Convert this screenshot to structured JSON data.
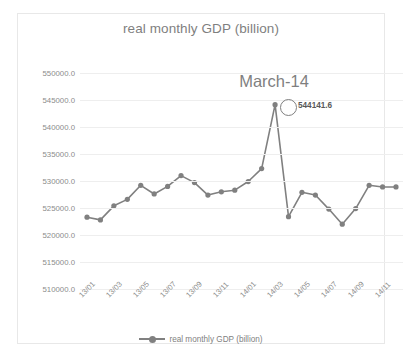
{
  "chart_data": {
    "type": "line",
    "title": "real monthly GDP (billion)",
    "xlabel": "",
    "ylabel": "",
    "ylim": [
      510000,
      550000
    ],
    "ytick_step": 5000,
    "ytick_labels": [
      "550000.0",
      "545000.0",
      "540000.0",
      "535000.0",
      "530000.0",
      "525000.0",
      "520000.0",
      "515000.0",
      "510000.0"
    ],
    "ytick_values": [
      550000,
      545000,
      540000,
      535000,
      530000,
      525000,
      520000,
      515000,
      510000
    ],
    "grid": true,
    "legend_position": "bottom",
    "legend": [
      "real monthly GDP (billion)"
    ],
    "x": [
      "13/01",
      "13/02",
      "13/03",
      "13/04",
      "13/05",
      "13/06",
      "13/07",
      "13/08",
      "13/09",
      "13/10",
      "13/11",
      "13/12",
      "14/01",
      "14/02",
      "14/03",
      "14/04",
      "14/05",
      "14/06",
      "14/07",
      "14/08",
      "14/09",
      "14/10",
      "14/11",
      "14/12"
    ],
    "xtick_labels": [
      "13/01",
      "13/03",
      "13/05",
      "13/07",
      "13/09",
      "13/11",
      "14/01",
      "14/03",
      "14/05",
      "14/07",
      "14/09",
      "14/11"
    ],
    "series": [
      {
        "name": "real monthly GDP (billion)",
        "color": "#808080",
        "values": [
          523300,
          522800,
          525400,
          526600,
          529200,
          527600,
          529000,
          531000,
          529700,
          527400,
          528000,
          528300,
          529900,
          532300,
          544141.6,
          523400,
          527900,
          527400,
          524800,
          522000,
          524900,
          529200,
          528900,
          528900
        ]
      }
    ],
    "annotations": [
      {
        "name": "peak-callout",
        "text": "March-14",
        "point_label": "544141.6",
        "x": "14/03",
        "y": 544141.6
      }
    ]
  }
}
